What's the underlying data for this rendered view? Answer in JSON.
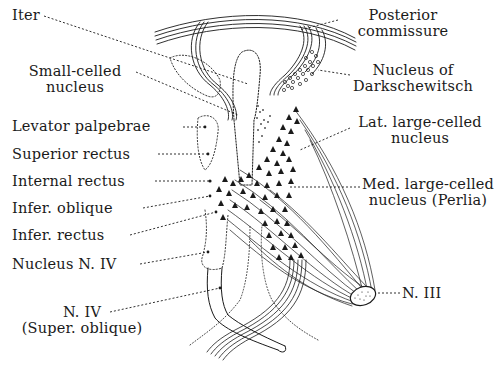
{
  "figure": {
    "colors": {
      "ink": "#1a1a1a",
      "background": "#ffffff"
    }
  },
  "labels": {
    "left": [
      {
        "id": "iter",
        "lines": [
          "Iter"
        ]
      },
      {
        "id": "small_celled",
        "lines": [
          "Small-celled",
          "nucleus"
        ]
      },
      {
        "id": "levator",
        "lines": [
          "Levator palpebrae"
        ]
      },
      {
        "id": "superior_rectus",
        "lines": [
          "Superior rectus"
        ]
      },
      {
        "id": "internal_rectus",
        "lines": [
          "Internal rectus"
        ]
      },
      {
        "id": "infer_oblique",
        "lines": [
          "Infer. oblique"
        ]
      },
      {
        "id": "infer_rectus",
        "lines": [
          "Infer. rectus"
        ]
      },
      {
        "id": "nucleus_n4",
        "lines": [
          "Nucleus N. IV"
        ]
      },
      {
        "id": "n4_super_oblique",
        "lines": [
          "N. IV",
          "(Super. oblique)"
        ]
      }
    ],
    "right": [
      {
        "id": "posterior_commissure",
        "lines": [
          "Posterior",
          "commissure"
        ]
      },
      {
        "id": "darkschewitsch",
        "lines": [
          "Nucleus of",
          "Darkschewitsch"
        ]
      },
      {
        "id": "lat_large",
        "lines": [
          "Lat. large-celled",
          "nucleus"
        ]
      },
      {
        "id": "med_large",
        "lines": [
          "Med. large-celled",
          "nucleus (Perlia)"
        ]
      },
      {
        "id": "n3",
        "lines": [
          "N. III"
        ]
      }
    ]
  }
}
